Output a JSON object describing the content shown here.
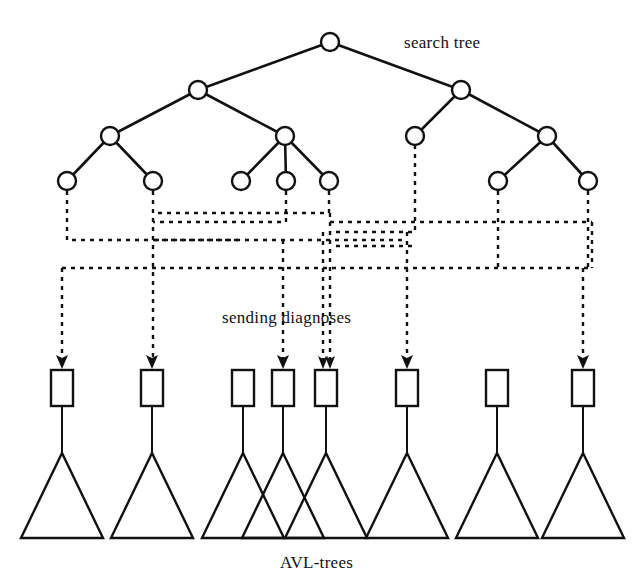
{
  "figure": {
    "background_color": "#ffffff",
    "ink_color": "#111111",
    "width": 638,
    "height": 571
  },
  "labels": {
    "search_tree": "search tree",
    "sending_diagnoses": "sending diagnoses",
    "avl_trees": "AVL-trees"
  },
  "search_tree": {
    "levels": [
      {
        "level": 0,
        "y": 42,
        "nodes": [
          {
            "id": "root",
            "x": 330
          }
        ]
      },
      {
        "level": 1,
        "y": 90,
        "nodes": [
          {
            "id": "L1a",
            "x": 198
          },
          {
            "id": "L1b",
            "x": 461
          }
        ]
      },
      {
        "level": 2,
        "y": 136,
        "nodes": [
          {
            "id": "L2a",
            "x": 110
          },
          {
            "id": "L2b",
            "x": 285
          },
          {
            "id": "L2c",
            "x": 415
          },
          {
            "id": "L2d",
            "x": 547
          }
        ]
      },
      {
        "level": 3,
        "y": 181,
        "nodes": [
          {
            "id": "L3a",
            "x": 67
          },
          {
            "id": "L3b",
            "x": 153
          },
          {
            "id": "L3c",
            "x": 241
          },
          {
            "id": "L3d",
            "x": 286
          },
          {
            "id": "L3e",
            "x": 329
          },
          {
            "id": "L3f",
            "x": 498
          },
          {
            "id": "L3g",
            "x": 588
          }
        ]
      }
    ],
    "node_radius": 9,
    "edges": [
      {
        "from": "root",
        "to": "L1a"
      },
      {
        "from": "root",
        "to": "L1b"
      },
      {
        "from": "L1a",
        "to": "L2a"
      },
      {
        "from": "L1a",
        "to": "L2b"
      },
      {
        "from": "L1b",
        "to": "L2c"
      },
      {
        "from": "L1b",
        "to": "L2d"
      },
      {
        "from": "L2a",
        "to": "L3a"
      },
      {
        "from": "L2a",
        "to": "L3b"
      },
      {
        "from": "L2b",
        "to": "L3c"
      },
      {
        "from": "L2b",
        "to": "L3d"
      },
      {
        "from": "L2b",
        "to": "L3e"
      },
      {
        "from": "L2d",
        "to": "L3f"
      },
      {
        "from": "L2d",
        "to": "L3g"
      }
    ]
  },
  "boxes": {
    "y_top": 370,
    "width": 22,
    "height": 36,
    "items": [
      {
        "id": "B1",
        "x": 62,
        "has_arrow": true,
        "arrow_count": 1
      },
      {
        "id": "B2",
        "x": 152,
        "has_arrow": true,
        "arrow_count": 1
      },
      {
        "id": "B3",
        "x": 243,
        "has_arrow": false,
        "arrow_count": 0
      },
      {
        "id": "B4",
        "x": 283,
        "has_arrow": true,
        "arrow_count": 1
      },
      {
        "id": "B5",
        "x": 326,
        "has_arrow": true,
        "arrow_count": 2
      },
      {
        "id": "B6",
        "x": 407,
        "has_arrow": true,
        "arrow_count": 1
      },
      {
        "id": "B7",
        "x": 497,
        "has_arrow": false,
        "arrow_count": 0
      },
      {
        "id": "B8",
        "x": 583,
        "has_arrow": true,
        "arrow_count": 1
      }
    ]
  },
  "triangles": {
    "apex_y": 453,
    "base_y": 538,
    "half_width": 41,
    "apexes": [
      62,
      152,
      243,
      283,
      326,
      407,
      497,
      583
    ]
  },
  "diagnose_links": [
    {
      "id": "d1",
      "from_node": "L3a",
      "to_box": "B3",
      "bus_y": 240,
      "note": "left leaf routes right to mid bus"
    },
    {
      "id": "d2",
      "from_node": "L3b",
      "to_box": "B2",
      "bus_y": 222,
      "note": "second leaf drops straight down"
    },
    {
      "id": "d3",
      "from_node": "L3d",
      "to_box": "B4",
      "bus_y": 222
    },
    {
      "id": "d4",
      "from_node": "L3e",
      "to_box": "B5",
      "bus_y": 232
    },
    {
      "id": "d5",
      "from_node": "L2c",
      "to_box": "B6",
      "bus_y": 232
    },
    {
      "id": "d6",
      "from_node": "L3f",
      "to_box": "B1",
      "bus_y": 268
    },
    {
      "id": "d7",
      "from_node": "L3g",
      "to_box": "B8",
      "bus_y": 268
    },
    {
      "id": "d8",
      "from_node": "L3c",
      "to_box": "B5",
      "bus_y": 255
    }
  ],
  "label_positions": {
    "search_tree": {
      "x": 404,
      "y": 48
    },
    "sending_diagnoses": {
      "x": 222,
      "y": 323
    },
    "avl_trees": {
      "x": 280,
      "y": 568
    }
  }
}
